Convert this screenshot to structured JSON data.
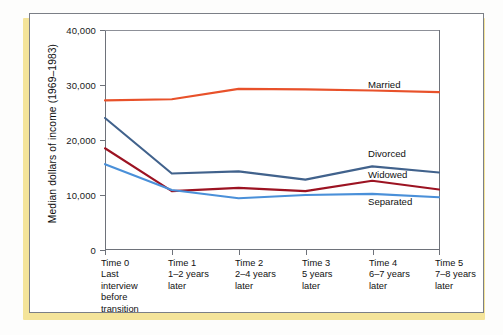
{
  "figure": {
    "accent_color": "#f4e49a",
    "frame_color": "#7b7f86",
    "background": "#ffffff"
  },
  "chart_data": {
    "type": "line",
    "title": "",
    "xlabel": "",
    "ylabel": "Median dollars of income (1969–1983)",
    "ylim": [
      0,
      40000
    ],
    "yticks": [
      0,
      10000,
      20000,
      30000,
      40000
    ],
    "ytick_labels": [
      "0",
      "10,000",
      "20,000",
      "30,000",
      "40,000"
    ],
    "grid": false,
    "legend_position": "right-inline",
    "categories": [
      "Time 0",
      "Time 1",
      "Time 2",
      "Time 3",
      "Time 4",
      "Time 5"
    ],
    "category_sublabels": [
      "Last interview before transition",
      "1–2 years later",
      "2–4 years later",
      "5 years later",
      "6–7 years later",
      "7–8 years later"
    ],
    "series": [
      {
        "name": "Married",
        "color": "#e8512a",
        "values": [
          27200,
          27400,
          29300,
          29200,
          29000,
          28700
        ]
      },
      {
        "name": "Divorced",
        "color": "#41628c",
        "values": [
          24000,
          13900,
          14300,
          12800,
          15200,
          14100
        ]
      },
      {
        "name": "Widowed",
        "color": "#9c1322",
        "values": [
          18500,
          10700,
          11300,
          10700,
          12600,
          11000
        ]
      },
      {
        "name": "Separated",
        "color": "#4a90d9",
        "values": [
          15600,
          10900,
          9400,
          10000,
          10200,
          9600
        ]
      }
    ]
  },
  "xaxis": {
    "ticks": [
      {
        "name": "Time 0",
        "lines": [
          "Last",
          "interview",
          "before",
          "transition"
        ]
      },
      {
        "name": "Time 1",
        "lines": [
          "1–2 years",
          "later"
        ]
      },
      {
        "name": "Time 2",
        "lines": [
          "2–4 years",
          "later"
        ]
      },
      {
        "name": "Time 3",
        "lines": [
          "5 years",
          "later"
        ]
      },
      {
        "name": "Time 4",
        "lines": [
          "6–7 years",
          "later"
        ]
      },
      {
        "name": "Time 5",
        "lines": [
          "7–8 years",
          "later"
        ]
      }
    ]
  },
  "yaxis": {
    "label": "Median dollars of income (1969–1983)",
    "tick_labels": [
      "40,000",
      "30,000",
      "20,000",
      "10,000",
      "0"
    ]
  },
  "series_labels": [
    {
      "text": "Married",
      "top": 79,
      "left": 368
    },
    {
      "text": "Divorced",
      "top": 148,
      "left": 368
    },
    {
      "text": "Widowed",
      "top": 169,
      "left": 368
    },
    {
      "text": "Separated",
      "top": 196,
      "left": 368
    }
  ]
}
